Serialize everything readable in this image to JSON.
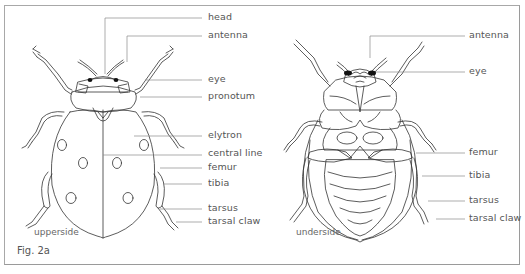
{
  "figure": {
    "caption": "Fig. 2a",
    "views": {
      "upperside": "upperside",
      "underside": "underside"
    },
    "upperside_labels": [
      {
        "text": "head"
      },
      {
        "text": "antenna"
      },
      {
        "text": "eye"
      },
      {
        "text": "pronotum"
      },
      {
        "text": "elytron"
      },
      {
        "text": "central line"
      },
      {
        "text": "femur"
      },
      {
        "text": "tibia"
      },
      {
        "text": "tarsus"
      },
      {
        "text": "tarsal claw"
      }
    ],
    "underside_labels": [
      {
        "text": "antenna"
      },
      {
        "text": "eye"
      },
      {
        "text": "femur"
      },
      {
        "text": "tibia"
      },
      {
        "text": "tarsus"
      },
      {
        "text": "tarsal claw"
      }
    ],
    "colors": {
      "frame": "#a8a8a8",
      "line_art": "#333333",
      "leader_lines": "#8a8a8a",
      "text": "#555555"
    }
  }
}
